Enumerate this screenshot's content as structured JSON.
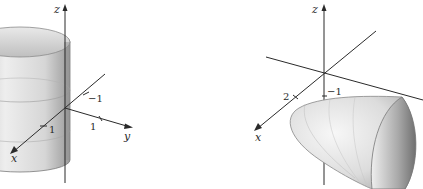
{
  "figures": [
    {
      "name": "cylinder",
      "surface": "circular cylinder along z-axis",
      "axes": {
        "z": "z",
        "y": "y",
        "x": "x"
      },
      "ticks": {
        "neg_one": "−1",
        "y_one": "1",
        "x_one": "1"
      }
    },
    {
      "name": "paraboloid",
      "surface": "elliptic paraboloid opening along y-axis",
      "axes": {
        "z": "z",
        "x": "x"
      },
      "ticks": {
        "two": "2",
        "neg_one": "−1"
      }
    }
  ],
  "colors": {
    "axis": "#2a2a2a",
    "surface_light": "#f2f2f2",
    "surface_mid": "#c8c8c8",
    "surface_dark": "#8a8a8a",
    "background": "#ffffff"
  }
}
